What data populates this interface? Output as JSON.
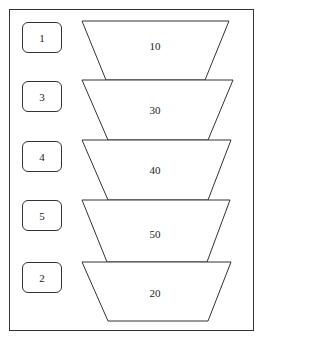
{
  "diagram": {
    "labels": [
      "1",
      "3",
      "4",
      "5",
      "2"
    ],
    "stages": [
      {
        "value": "10"
      },
      {
        "value": "30"
      },
      {
        "value": "40"
      },
      {
        "value": "50"
      },
      {
        "value": "20"
      }
    ],
    "colors": {
      "stroke": "#333333",
      "fill": "#ffffff"
    }
  }
}
